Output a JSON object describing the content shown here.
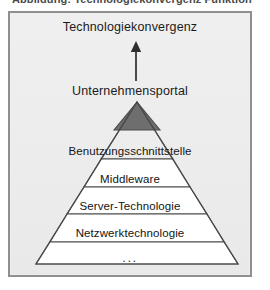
{
  "caption": {
    "text": "Abbildung: Technologiekonvergenz Funktion"
  },
  "figure": {
    "top_label": "Technologiekonvergenz",
    "arrow": {
      "name": "up-arrow",
      "direction": "up"
    },
    "portal_label": "Unternehmensportal",
    "apex": {
      "label": "",
      "fill": "#6e6e6e"
    },
    "layers": [
      {
        "label": "Benutzungsschnittstelle",
        "fill": "#ffffff"
      },
      {
        "label": "Middleware",
        "fill": "#ffffff"
      },
      {
        "label": "Server-Technologie",
        "fill": "#ffffff"
      },
      {
        "label": "Netzwerktechnologie",
        "fill": "#ffffff"
      },
      {
        "label": "...",
        "fill": "#ffffff"
      }
    ],
    "colors": {
      "panel_background": "#eeeeee",
      "panel_border": "#8f8f8f",
      "pyramid_stroke": "#4a4a4a",
      "pyramid_fill": "#ffffff",
      "apex_fill": "#6e6e6e",
      "text": "#141414"
    }
  }
}
